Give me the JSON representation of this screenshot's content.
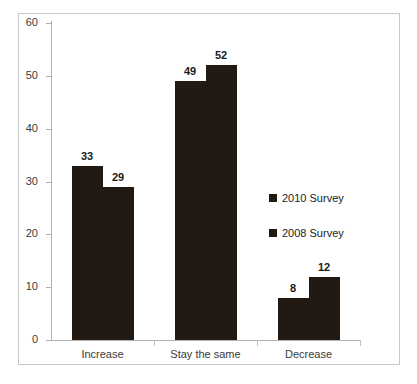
{
  "chart_data": {
    "type": "bar",
    "title": "",
    "subtitle": "",
    "xlabel": "",
    "ylabel": "",
    "categories": [
      "Increase",
      "Stay the same",
      "Decrease"
    ],
    "series": [
      {
        "name": "2010 Survey",
        "values": [
          33,
          49,
          8
        ],
        "color": "#221a12"
      },
      {
        "name": "2008 Survey",
        "values": [
          29,
          52,
          12
        ],
        "color": "#221a12"
      }
    ],
    "ylim": [
      0,
      60
    ],
    "y_ticks": [
      0,
      10,
      20,
      30,
      40,
      50,
      60
    ],
    "y_tick_labels": [
      "0",
      "10",
      "20",
      "30",
      "40",
      "50",
      "60"
    ],
    "grid": false,
    "legend_position": "inside-right",
    "data_labels": true,
    "data_label_values": [
      [
        "33",
        "29"
      ],
      [
        "49",
        "52"
      ],
      [
        "8",
        "12"
      ]
    ],
    "bar_color": "#221a12",
    "axis_color": "#b0b0b0",
    "border_color": "#c9c9c9",
    "background_color": "#ffffff"
  },
  "legend": {
    "items": [
      {
        "label": "2010 Survey",
        "marker": "square-marker"
      },
      {
        "label": "2008 Survey",
        "marker": "square-marker"
      }
    ]
  }
}
